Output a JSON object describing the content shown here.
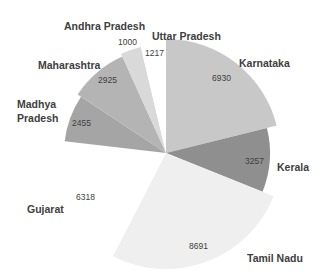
{
  "chart_data": {
    "type": "pie",
    "subtype": "variable-radius pie",
    "title": "",
    "start_angle_deg": 0,
    "direction": "clockwise",
    "slices": [
      {
        "label": "Karnataka",
        "value": 6930,
        "color": "#c8c8c8",
        "radius": 114
      },
      {
        "label": "Kerala",
        "value": 3257,
        "color": "#8f8f8f",
        "radius": 104
      },
      {
        "label": "Tamil Nadu",
        "value": 8691,
        "color": "#efefef",
        "radius": 116
      },
      {
        "label": "Gujarat",
        "value": 6318,
        "color": "#ffffff",
        "radius": 110
      },
      {
        "label": "Madhya Pradesh",
        "value": 2455,
        "color": "#a5a5a5",
        "radius": 102
      },
      {
        "label": "Maharashtra",
        "value": 2925,
        "color": "#b4b4b4",
        "radius": 106
      },
      {
        "label": "Andhra Pradesh",
        "value": 1000,
        "color": "#d9d9d9",
        "radius": 109
      },
      {
        "label": "Uttar Pradesh",
        "value": 1217,
        "color": "#ffffff",
        "radius": 112
      }
    ],
    "categories": [
      "Karnataka",
      "Kerala",
      "Tamil Nadu",
      "Gujarat",
      "Madhya Pradesh",
      "Maharashtra",
      "Andhra Pradesh",
      "Uttar Pradesh"
    ],
    "values": [
      6930,
      3257,
      8691,
      6318,
      2455,
      2925,
      1000,
      1217
    ],
    "legend": "none (category labels placed outside slices)",
    "labels": {
      "Karnataka": {
        "name": "Karnataka",
        "value_text": "6930"
      },
      "Kerala": {
        "name": "Kerala",
        "value_text": "3257"
      },
      "Tamil Nadu": {
        "name": "Tamil Nadu",
        "value_text": "8691"
      },
      "Gujarat": {
        "name": "Gujarat",
        "value_text": "6318"
      },
      "Madhya Pradesh": {
        "name_line1": "Madhya",
        "name_line2": "Pradesh",
        "value_text": "2455"
      },
      "Maharashtra": {
        "name": "Maharashtra",
        "value_text": "2925"
      },
      "Andhra Pradesh": {
        "name": "Andhra Pradesh",
        "value_text": "1000"
      },
      "Uttar Pradesh": {
        "name": "Uttar Pradesh",
        "value_text": "1217"
      }
    }
  }
}
